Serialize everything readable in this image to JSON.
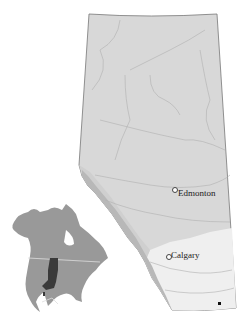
{
  "map": {
    "region": "Alberta",
    "cities": [
      {
        "name": "Edmonton",
        "x": 173,
        "y": 188
      },
      {
        "name": "Calgary",
        "x": 167,
        "y": 255
      }
    ],
    "marker": {
      "x": 220,
      "y": 303
    },
    "colors": {
      "province_fill": "#d8d8d8",
      "mountain_band": "#b8b8b8",
      "foothills": "#cfcfcf",
      "prairie": "#efefef",
      "rivers": "#b0b0b0",
      "border": "#777777",
      "inset_land": "#999999",
      "inset_range": "#3a3a3a"
    }
  },
  "inset": {
    "title": "North America locator",
    "highlight": "species range"
  }
}
